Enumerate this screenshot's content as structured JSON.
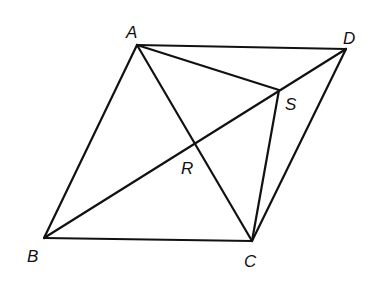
{
  "diagram": {
    "type": "geometry",
    "stroke_color": "#111111",
    "background": "#ffffff",
    "points": {
      "A": {
        "x": 137,
        "y": 45,
        "label": "A",
        "lx": 126,
        "ly": 38
      },
      "D": {
        "x": 346,
        "y": 49,
        "label": "D",
        "lx": 343,
        "ly": 44
      },
      "S": {
        "x": 279,
        "y": 90,
        "label": "S",
        "lx": 285,
        "ly": 110
      },
      "R": {
        "x": 195,
        "y": 143,
        "label": "R",
        "lx": 181,
        "ly": 174
      },
      "B": {
        "x": 44,
        "y": 238,
        "label": "B",
        "lx": 27,
        "ly": 262
      },
      "C": {
        "x": 252,
        "y": 241,
        "label": "C",
        "lx": 244,
        "ly": 267
      }
    },
    "segments": [
      [
        "A",
        "D"
      ],
      [
        "A",
        "B"
      ],
      [
        "B",
        "C"
      ],
      [
        "C",
        "D"
      ],
      [
        "A",
        "C"
      ],
      [
        "B",
        "D"
      ],
      [
        "A",
        "S"
      ],
      [
        "S",
        "C"
      ]
    ]
  }
}
